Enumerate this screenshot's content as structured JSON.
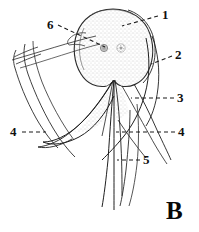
{
  "figure": {
    "panel_letter": "B",
    "background_color": "#ffffff",
    "ink_color": "#1a1a1a",
    "stipple_color": "#8a8a8a",
    "width": 199,
    "height": 232
  },
  "labels": [
    {
      "id": "label-1",
      "text": "1",
      "x": 162,
      "y": 10,
      "leader_from": [
        158,
        18
      ],
      "leader_to": [
        120,
        28
      ]
    },
    {
      "id": "label-2",
      "text": "2",
      "x": 175,
      "y": 50,
      "leader_from": [
        171,
        58
      ],
      "leader_to": [
        150,
        66
      ]
    },
    {
      "id": "label-3",
      "text": "3",
      "x": 177,
      "y": 93,
      "leader_from": [
        173,
        100
      ],
      "leader_to": [
        131,
        100
      ]
    },
    {
      "id": "label-4-right",
      "text": "4",
      "x": 178,
      "y": 127,
      "leader_from": [
        174,
        134
      ],
      "leader_to": [
        115,
        134
      ]
    },
    {
      "id": "label-4-left",
      "text": "4",
      "x": 11,
      "y": 127,
      "leader_from": [
        21,
        134
      ],
      "leader_to": [
        45,
        134
      ]
    },
    {
      "id": "label-5",
      "text": "5",
      "x": 143,
      "y": 155,
      "leader_from": [
        139,
        162
      ],
      "leader_to": [
        115,
        162
      ]
    },
    {
      "id": "label-6",
      "text": "6",
      "x": 48,
      "y": 20,
      "leader_from": [
        57,
        28
      ],
      "leader_to": [
        104,
        48
      ]
    }
  ],
  "structures": {
    "body_outline": "ovoid stippled capsule",
    "inner_spots": [
      {
        "name": "spot-left",
        "cx": 104,
        "cy": 48,
        "r": 3.6
      },
      {
        "name": "spot-right",
        "cx": 121,
        "cy": 48,
        "r": 4.2
      }
    ]
  }
}
